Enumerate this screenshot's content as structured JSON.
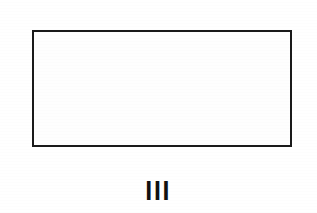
{
  "document": {
    "type": "scanned-figure",
    "background_color": "#ffffff"
  },
  "figure": {
    "caption": "III",
    "caption_meaning": "roman-numeral-three",
    "frame": {
      "label": "",
      "interior_text": "",
      "is_empty": true,
      "border_color": "#1a1a1a",
      "fill_color": "#ffffff",
      "border_width_px": 2,
      "x": 32,
      "y": 30,
      "width": 260,
      "height": 117
    }
  }
}
